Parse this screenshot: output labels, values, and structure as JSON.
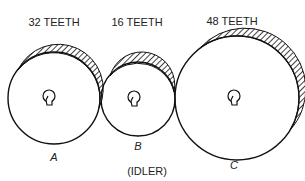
{
  "gears": [
    {
      "id": "A",
      "teeth_label": "32 TEETH",
      "letter": "A",
      "cx": 54,
      "cy": 98,
      "r": 46
    },
    {
      "id": "B",
      "teeth_label": "16 TEETH",
      "letter": "B",
      "cx": 138,
      "cy": 99,
      "r": 37
    },
    {
      "id": "C",
      "teeth_label": "48 TEETH",
      "letter": "C",
      "cx": 237,
      "cy": 98,
      "r": 62
    }
  ],
  "idler_note": "(IDLER)",
  "colors": {
    "line": "#111111",
    "background": "#ffffff"
  }
}
